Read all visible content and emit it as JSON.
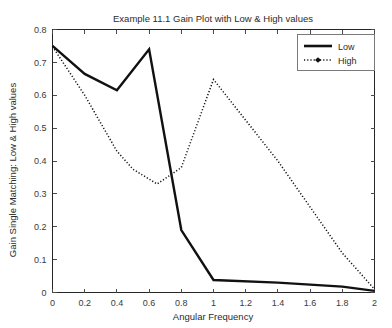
{
  "chart_data": {
    "type": "line",
    "title": "Example 11.1 Gain Plot with Low & High values",
    "xlabel": "Angular Frequency",
    "ylabel": "Gain Single Matching: Low & High values",
    "xlim": [
      0,
      2
    ],
    "ylim": [
      0,
      0.8
    ],
    "grid": false,
    "legend_position": "top-right",
    "xticks": [
      "0",
      "0.2",
      "0.4",
      "0.6",
      "0.8",
      "1",
      "1.2",
      "1.4",
      "1.6",
      "1.8",
      "2"
    ],
    "xtick_values": [
      0,
      0.2,
      0.4,
      0.6,
      0.8,
      1.0,
      1.2,
      1.4,
      1.6,
      1.8,
      2.0
    ],
    "yticks": [
      "0",
      "0.1",
      "0.2",
      "0.3",
      "0.4",
      "0.5",
      "0.6",
      "0.7",
      "0.8"
    ],
    "ytick_values": [
      0,
      0.1,
      0.2,
      0.3,
      0.4,
      0.5,
      0.6,
      0.7,
      0.8
    ],
    "series": [
      {
        "name": "Low",
        "style": "solid",
        "color": "#111111",
        "x": [
          0,
          0.2,
          0.4,
          0.6,
          0.8,
          1.0,
          1.4,
          1.8,
          2.0
        ],
        "values": [
          0.75,
          0.665,
          0.615,
          0.74,
          0.19,
          0.038,
          0.03,
          0.018,
          0.005
        ]
      },
      {
        "name": "High",
        "style": "dotted",
        "color": "#111111",
        "x": [
          0,
          0.2,
          0.4,
          0.5,
          0.65,
          0.8,
          1.0,
          1.4,
          1.8,
          2.0
        ],
        "values": [
          0.748,
          0.6,
          0.43,
          0.375,
          0.33,
          0.38,
          0.648,
          0.4,
          0.12,
          0.01
        ]
      }
    ]
  },
  "legend": {
    "entries": [
      {
        "label": "Low"
      },
      {
        "label": "High"
      }
    ]
  }
}
